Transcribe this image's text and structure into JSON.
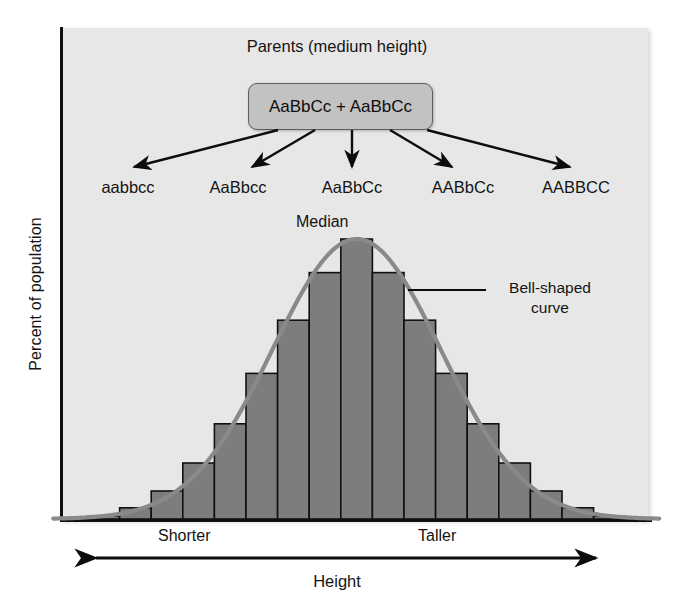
{
  "figure": {
    "parents_title": "Parents (medium height)",
    "parents_genotype": "AaBbCc + AaBbCc",
    "offspring": [
      {
        "label": "aabbcc",
        "x": 128
      },
      {
        "label": "AaBbcc",
        "x": 238
      },
      {
        "label": "AaBbCc",
        "x": 352
      },
      {
        "label": "AABbCc",
        "x": 463
      },
      {
        "label": "AABBCC",
        "x": 576
      }
    ],
    "median_label": "Median",
    "bell_label": "Bell-shaped curve",
    "shorter_label": "Shorter",
    "taller_label": "Taller",
    "x_axis_title": "Height",
    "y_axis_title": "Percent of population",
    "colors": {
      "panel_background": "#e7e7e7",
      "bar_fill": "#7d7d7d",
      "bar_stroke": "#111111",
      "curve": "#8a8a8a",
      "box_fill": "#c2c2c2",
      "box_stroke": "#5d5d5d",
      "axis": "#111111",
      "text": "#141414"
    }
  },
  "chart_data": {
    "type": "bar",
    "xlabel": "Height",
    "ylabel": "Percent of population",
    "grid": false,
    "legend": false,
    "annotations": [
      "Median",
      "Bell-shaped curve",
      "Shorter",
      "Taller"
    ],
    "xlim": [
      0,
      17
    ],
    "ylim": [
      0,
      100
    ],
    "categories": [
      "1",
      "2",
      "3",
      "4",
      "5",
      "6",
      "7",
      "8",
      "9",
      "10",
      "11",
      "12",
      "13",
      "14",
      "15",
      "16",
      "17"
    ],
    "values": [
      1,
      4,
      10,
      20,
      34,
      52,
      71,
      88,
      100,
      88,
      71,
      52,
      34,
      20,
      10,
      4,
      1
    ],
    "overlay_curve": {
      "type": "line",
      "name": "Bell-shaped curve",
      "values": [
        1,
        4,
        10,
        20,
        34,
        52,
        71,
        88,
        100,
        88,
        71,
        52,
        34,
        20,
        10,
        4,
        1
      ]
    }
  }
}
